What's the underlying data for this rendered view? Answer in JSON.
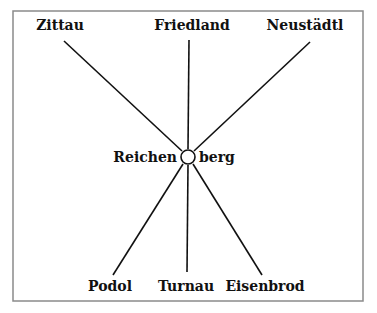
{
  "diagram": {
    "type": "radial-network",
    "center": {
      "label_left": "Reichen",
      "label_right": "berg",
      "full_name": "Reichenberg",
      "x": 188,
      "y": 157,
      "r": 7
    },
    "nodes": [
      {
        "id": "zittau",
        "label": "Zittau",
        "position": "top-left",
        "lx": 60,
        "ly": 30,
        "x1": 64,
        "y1": 41,
        "x2": 182,
        "y2": 151
      },
      {
        "id": "friedland",
        "label": "Friedland",
        "position": "top-center",
        "lx": 192,
        "ly": 30,
        "x1": 189,
        "y1": 40,
        "x2": 188,
        "y2": 149
      },
      {
        "id": "neustadtl",
        "label": "Neustädtl",
        "position": "top-right",
        "lx": 305,
        "ly": 30,
        "x1": 310,
        "y1": 42,
        "x2": 194,
        "y2": 151
      },
      {
        "id": "podol",
        "label": "Podol",
        "position": "bottom-left",
        "lx": 110,
        "ly": 291,
        "x1": 113,
        "y1": 275,
        "x2": 183,
        "y2": 164
      },
      {
        "id": "turnau",
        "label": "Turnau",
        "position": "bottom-center",
        "lx": 186,
        "ly": 291,
        "x1": 187,
        "y1": 272,
        "x2": 188,
        "y2": 165
      },
      {
        "id": "eisenbrod",
        "label": "Eisenbrod",
        "position": "bottom-right",
        "lx": 265,
        "ly": 291,
        "x1": 262,
        "y1": 275,
        "x2": 193,
        "y2": 164
      }
    ],
    "frame": {
      "x": 13,
      "y": 11,
      "width": 350,
      "height": 290,
      "color": "#8a8a8a"
    },
    "line_color": "#111111"
  }
}
